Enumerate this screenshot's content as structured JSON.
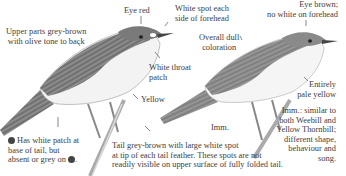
{
  "bird_left": {
    "labels": {
      "eye": "Eye red",
      "forehead": [
        "White spot each",
        "side of forehead"
      ],
      "upperparts": [
        "Upper parts grey-brown",
        "with olive tone to back"
      ],
      "throat": [
        "White throat",
        "patch"
      ],
      "belly": "Yellow"
    },
    "tail_note": {
      "line1": "Has white patch at",
      "line2": "base of tail, but",
      "line3": "absent or grey on",
      "symbol_male": "male-symbol-icon",
      "symbol_female": "female-symbol-icon"
    }
  },
  "bird_right": {
    "labels": {
      "eye": [
        "Eye brown;",
        "no white on forehead"
      ],
      "coloration": [
        "Overall dull",
        "coloration"
      ],
      "belly": [
        "Entirely",
        "pale yellow"
      ],
      "age": "Imm."
    },
    "imm_note": [
      "Imm.: similar to",
      "both Weebill and",
      "Yellow Thornbill;",
      "different shape,",
      "behaviour and",
      "song."
    ]
  },
  "tail_caption": [
    "Tail grey-brown with large white spot",
    "at tip of each tail feather. These spots are not",
    "readily visible on upper surface of fully folded tail."
  ],
  "colors": {
    "text": "#3d3d3d",
    "plumage_dark": "#5a5a5a",
    "plumage_mid": "#8a8a8a",
    "plumage_light": "#f4f4f4"
  }
}
